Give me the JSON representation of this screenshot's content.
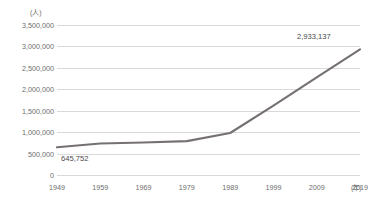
{
  "chart_data": {
    "type": "line",
    "title": "",
    "subtitle": "",
    "xlabel": "年",
    "ylabel": "人",
    "x": [
      1949,
      1959,
      1969,
      1979,
      1989,
      1999,
      2009,
      2019
    ],
    "categories": [
      "1949",
      "1959",
      "1969",
      "1979",
      "1989",
      "1999",
      "2009",
      "2019"
    ],
    "series": [
      {
        "name": "人数",
        "values": [
          645752,
          735000,
          760000,
          790000,
          980000,
          1620000,
          2280000,
          2933137
        ]
      }
    ],
    "xlim": [
      1949,
      2019
    ],
    "ylim": [
      0,
      3500000
    ],
    "grid": true,
    "legend": false,
    "legend_position": "none",
    "line_color": "#767171",
    "grid_color": "#d9d9d9",
    "y_ticks": [
      {
        "value": 3500000,
        "label": "3,500,000"
      },
      {
        "value": 3000000,
        "label": "3,000,000"
      },
      {
        "value": 2500000,
        "label": "2,500,000"
      },
      {
        "value": 2000000,
        "label": "2,000,000"
      },
      {
        "value": 1500000,
        "label": "1,500,000"
      },
      {
        "value": 1000000,
        "label": "1,000,000"
      },
      {
        "value": 500000,
        "label": "500,000"
      },
      {
        "value": 0,
        "label": "0"
      }
    ],
    "annotations": [
      {
        "name": "first-point-value",
        "x": 1949,
        "value": 645752,
        "label": "645,752"
      },
      {
        "name": "last-point-value",
        "x": 2019,
        "value": 2933137,
        "label": "2,933,137"
      }
    ],
    "axis_units": {
      "y_unit": "(人)",
      "x_unit": "(年)"
    }
  }
}
